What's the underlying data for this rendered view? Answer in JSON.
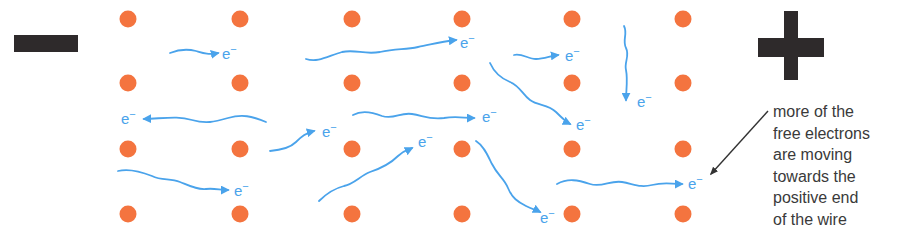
{
  "colors": {
    "ion": "#F4743F",
    "electron_path": "#4AA3EB",
    "terminal": "#2E2A2B",
    "text": "#3A3A3A"
  },
  "terminals": {
    "negative": {
      "symbol": "minus",
      "side": "left"
    },
    "positive": {
      "symbol": "plus",
      "side": "right"
    }
  },
  "ion_grid": {
    "rows": 4,
    "columns": 6
  },
  "electron_label": {
    "base": "e",
    "charge": "−"
  },
  "electrons": [
    {
      "direction": "right"
    },
    {
      "direction": "right"
    },
    {
      "direction": "right"
    },
    {
      "direction": "down"
    },
    {
      "direction": "left"
    },
    {
      "direction": "down-right"
    },
    {
      "direction": "up-right"
    },
    {
      "direction": "right"
    },
    {
      "direction": "up-right"
    },
    {
      "direction": "down-right"
    },
    {
      "direction": "right"
    },
    {
      "direction": "right"
    }
  ],
  "annotation": {
    "lines": [
      "more of the",
      "free electrons",
      "are moving",
      "towards the",
      "positive end",
      "of the wire"
    ]
  }
}
